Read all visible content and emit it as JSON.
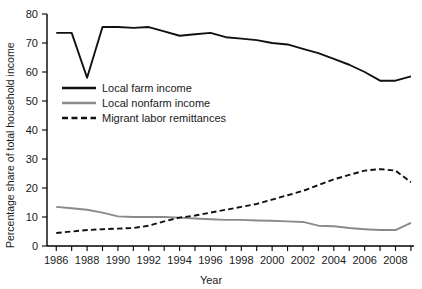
{
  "chart_data": {
    "type": "line",
    "title": "",
    "xlabel": "Year",
    "ylabel": "Percentage share of total household income",
    "xlim": [
      1985.4,
      2009.2
    ],
    "ylim": [
      0,
      80
    ],
    "grid": false,
    "legend_position": "upper-left-inside",
    "x": [
      1986,
      1987,
      1988,
      1989,
      1990,
      1991,
      1992,
      1993,
      1994,
      1995,
      1996,
      1997,
      1998,
      1999,
      2000,
      2001,
      2002,
      2003,
      2004,
      2005,
      2006,
      2007,
      2008,
      2009
    ],
    "xticks": [
      1986,
      1988,
      1990,
      1992,
      1994,
      1996,
      1998,
      2000,
      2002,
      2004,
      2006,
      2008
    ],
    "xticklabels": [
      "1986",
      "1988",
      "1990",
      "1992",
      "1994",
      "1996",
      "1998",
      "2000",
      "2002",
      "2004",
      "2006",
      "2008"
    ],
    "yticks": [
      0,
      10,
      20,
      30,
      40,
      50,
      60,
      70,
      80
    ],
    "yticklabels": [
      "0",
      "10",
      "20",
      "30",
      "40",
      "50",
      "60",
      "70",
      "80"
    ],
    "series": [
      {
        "name": "Local farm income",
        "color": "#111111",
        "style": "solid",
        "values": [
          73.5,
          73.5,
          58.0,
          75.5,
          75.5,
          75.2,
          75.5,
          74.0,
          72.5,
          73.0,
          73.5,
          72.0,
          71.5,
          71.0,
          70.0,
          69.5,
          68.0,
          66.5,
          64.5,
          62.5,
          60.0,
          57.0,
          57.0,
          58.5
        ]
      },
      {
        "name": "Local nonfarm income",
        "color": "#8a8a8a",
        "style": "solid",
        "values": [
          13.5,
          13.0,
          12.5,
          11.5,
          10.2,
          10.0,
          10.0,
          10.0,
          9.8,
          9.5,
          9.2,
          9.0,
          9.0,
          8.8,
          8.7,
          8.5,
          8.3,
          7.0,
          6.8,
          6.2,
          5.8,
          5.5,
          5.5,
          8.0
        ]
      },
      {
        "name": "Migrant labor remittances",
        "color": "#111111",
        "style": "dashed",
        "values": [
          4.5,
          5.0,
          5.5,
          5.8,
          6.0,
          6.2,
          7.0,
          8.5,
          9.8,
          10.5,
          11.5,
          12.5,
          13.5,
          14.5,
          16.0,
          17.5,
          19.0,
          21.0,
          23.0,
          24.5,
          26.0,
          26.5,
          26.0,
          22.0
        ]
      }
    ]
  },
  "legend": {
    "items": [
      {
        "label": "Local farm income"
      },
      {
        "label": "Local nonfarm income"
      },
      {
        "label": "Migrant labor remittances"
      }
    ]
  }
}
